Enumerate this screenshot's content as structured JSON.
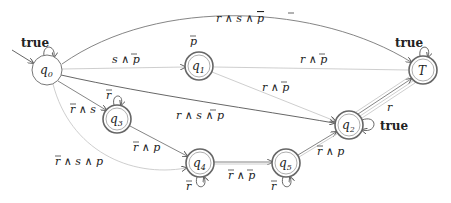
{
  "diagram": {
    "type": "automaton",
    "states": [
      {
        "id": "q0",
        "name": "q",
        "sub": "0",
        "accepting": false,
        "initial": true,
        "x": 47,
        "y": 70
      },
      {
        "id": "q1",
        "name": "q",
        "sub": "1",
        "accepting": true,
        "x": 199,
        "y": 66
      },
      {
        "id": "T",
        "name": "T",
        "sub": "",
        "accepting": true,
        "x": 423,
        "y": 70
      },
      {
        "id": "q2",
        "name": "q",
        "sub": "2",
        "accepting": true,
        "x": 349,
        "y": 125
      },
      {
        "id": "q3",
        "name": "q",
        "sub": "3",
        "accepting": true,
        "x": 117,
        "y": 119
      },
      {
        "id": "q4",
        "name": "q",
        "sub": "4",
        "accepting": true,
        "x": 200,
        "y": 163
      },
      {
        "id": "q5",
        "name": "q",
        "sub": "5",
        "accepting": true,
        "x": 286,
        "y": 163
      }
    ],
    "transitions": [
      {
        "from": "q0",
        "to": "q0",
        "label": "true"
      },
      {
        "from": "q0",
        "to": "T",
        "label": "r ∧ s ∧ p̄"
      },
      {
        "from": "q0",
        "to": "q1",
        "label": "s ∧ p̄"
      },
      {
        "from": "q0",
        "to": "T",
        "label": "r ∧ p̄"
      },
      {
        "from": "q0",
        "to": "q2",
        "label": "r ∧ s ∧ p̄"
      },
      {
        "from": "q0",
        "to": "q3",
        "label": "r̄ ∧ s"
      },
      {
        "from": "q0",
        "to": "q4",
        "label": "r̄ ∧ s ∧ p"
      },
      {
        "from": "q1",
        "to": "q1",
        "label": "p̄"
      },
      {
        "from": "q1",
        "to": "q2",
        "label": "r ∧ p̄"
      },
      {
        "from": "q3",
        "to": "q3",
        "label": "r̄"
      },
      {
        "from": "q3",
        "to": "q4",
        "label": "r̄ ∧ p"
      },
      {
        "from": "q4",
        "to": "q4",
        "label": "r̄"
      },
      {
        "from": "q4",
        "to": "q5",
        "label": "r̄ ∧ p̄"
      },
      {
        "from": "q5",
        "to": "q5",
        "label": "r̄"
      },
      {
        "from": "q5",
        "to": "q2",
        "label": "r̄ ∧ p"
      },
      {
        "from": "q2",
        "to": "q2",
        "label": "true"
      },
      {
        "from": "q2",
        "to": "T",
        "label": "r"
      },
      {
        "from": "T",
        "to": "T",
        "label": "true"
      }
    ]
  },
  "labels": {
    "q0_loop": "true",
    "q0_T_top": "r ∧ s ∧ ",
    "q0_q1": "s ∧ ",
    "q0_T_mid": "r ∧ ",
    "q1_loop": "p",
    "q1_q2": "r ∧ ",
    "q0_q2": "r ∧ s ∧ ",
    "q0_q3_r": "r",
    "q0_q3_rest": " ∧ s",
    "q3_loop": "r",
    "q3_q4_r": "r",
    "q3_q4_rest": " ∧ p",
    "q0_q4_r": "r",
    "q0_q4_rest": " ∧ s ∧ p",
    "q4_loop": "r",
    "q4_q5_r": "r",
    "q4_q5_mid": " ∧ ",
    "q5_loop": "r",
    "q5_q2_r": "r",
    "q5_q2_rest": " ∧ p",
    "q2_loop": "true",
    "q2_T": "r",
    "T_loop": "true",
    "p": "p",
    "q": "q",
    "T": "T",
    "sub0": "0",
    "sub1": "1",
    "sub2": "2",
    "sub3": "3",
    "sub4": "4",
    "sub5": "5"
  }
}
